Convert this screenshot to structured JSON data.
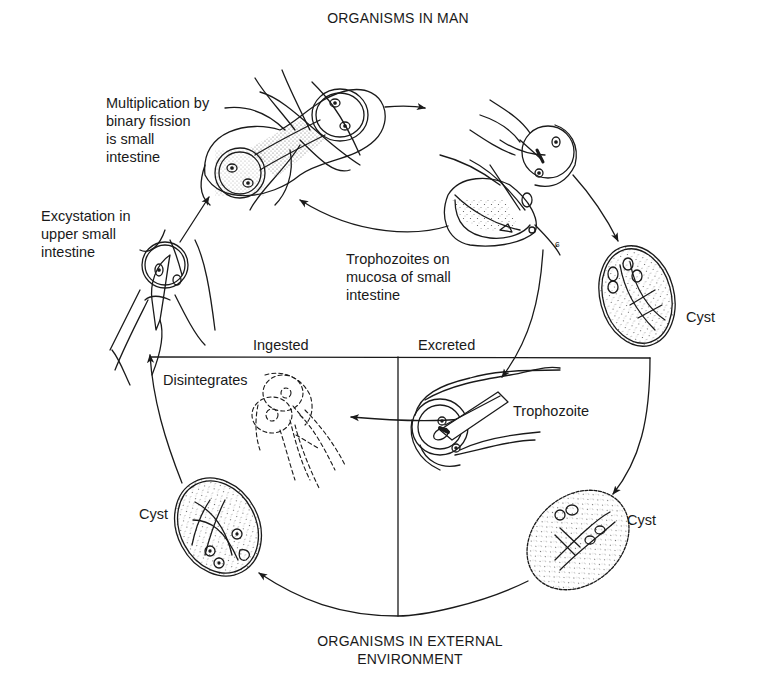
{
  "diagram": {
    "type": "life-cycle",
    "headings": {
      "top": "ORGANISMS IN MAN",
      "bottom": "ORGANISMS IN EXTERNAL\nENVIRONMENT"
    },
    "labels": {
      "multiplication": "Multiplication by\nbinary fission\nis small\nintestine",
      "excystation": "Excystation in\nupper small\nintestine",
      "trophozoites_mucosa": "Trophozoites on\nmucosa of small\nintestine",
      "cyst_upper_right": "Cyst",
      "ingested": "Ingested",
      "excreted": "Excreted",
      "disintegrates": "Disintegrates",
      "trophozoite_external": "Trophozoite",
      "cyst_lower_right": "Cyst",
      "cyst_lower_left": "Cyst"
    },
    "nodes": [
      {
        "id": "excystation",
        "label": "Excystation in upper small intestine",
        "stage": "man"
      },
      {
        "id": "binary-fission",
        "label": "Multiplication by binary fission is small intestine",
        "stage": "man"
      },
      {
        "id": "trophozoites-mucosa",
        "label": "Trophozoites on mucosa of small intestine",
        "stage": "man"
      },
      {
        "id": "cyst-in-man",
        "label": "Cyst",
        "stage": "man"
      },
      {
        "id": "trophozoite-external",
        "label": "Trophozoite",
        "stage": "external"
      },
      {
        "id": "disintegrates",
        "label": "Disintegrates",
        "stage": "external"
      },
      {
        "id": "cyst-external-right",
        "label": "Cyst",
        "stage": "external"
      },
      {
        "id": "cyst-external-left",
        "label": "Cyst",
        "stage": "external"
      }
    ],
    "edges": [
      {
        "from": "excystation",
        "to": "binary-fission"
      },
      {
        "from": "binary-fission",
        "to": "trophozoites-mucosa"
      },
      {
        "from": "trophozoites-mucosa",
        "to": "binary-fission"
      },
      {
        "from": "trophozoites-mucosa",
        "to": "cyst-in-man"
      },
      {
        "from": "trophozoites-mucosa",
        "to": "trophozoite-external",
        "label": "Excreted"
      },
      {
        "from": "trophozoite-external",
        "to": "disintegrates"
      },
      {
        "from": "cyst-in-man",
        "to": "cyst-external-right",
        "label": "Excreted"
      },
      {
        "from": "cyst-external-right",
        "to": "cyst-external-left"
      },
      {
        "from": "cyst-external-left",
        "to": "excystation",
        "label": "Ingested"
      }
    ],
    "colors": {
      "ink": "#1a1a1a",
      "background": "#ffffff",
      "stipple": "#555555"
    }
  }
}
